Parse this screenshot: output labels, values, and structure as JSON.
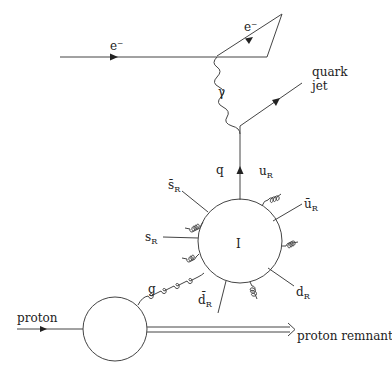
{
  "diagram": {
    "title": "",
    "labels": {
      "electron_in": "e⁻",
      "electron_out": "e⁻",
      "photon": "γ",
      "quark_jet_line1": "quark",
      "quark_jet_line2": "jet",
      "quark": "q",
      "instanton": "I",
      "gluon": "g",
      "proton": "proton",
      "proton_remnant": "proton remnant",
      "u_R": {
        "base": "u",
        "sub": "R"
      },
      "ubar_R": {
        "base": "ū",
        "sub": "R"
      },
      "d_R": {
        "base": "d",
        "sub": "R"
      },
      "dbar_R": {
        "base": "d̄",
        "sub": "R"
      },
      "s_R": {
        "base": "s",
        "sub": "R"
      },
      "sbar_R": {
        "base": "s̄",
        "sub": "R"
      }
    },
    "nodes": [
      {
        "id": "ee-gamma-vertex",
        "label": ""
      },
      {
        "id": "gamma-q-vertex",
        "label": ""
      },
      {
        "id": "instanton-blob",
        "label": "I"
      },
      {
        "id": "proton-blob",
        "label": ""
      }
    ],
    "edges": [
      {
        "from": "left",
        "to": "ee-gamma-vertex",
        "type": "fermion",
        "label": "e⁻"
      },
      {
        "from": "ee-gamma-vertex",
        "to": "upper-right",
        "type": "fermion",
        "label": "e⁻"
      },
      {
        "from": "ee-gamma-vertex",
        "to": "gamma-q-vertex",
        "type": "photon",
        "label": "γ"
      },
      {
        "from": "gamma-q-vertex",
        "to": "right",
        "type": "fermion",
        "label": "quark jet"
      },
      {
        "from": "instanton-blob",
        "to": "gamma-q-vertex",
        "type": "fermion",
        "label": "q"
      },
      {
        "from": "proton-blob",
        "to": "instanton-blob",
        "type": "gluon",
        "label": "g"
      },
      {
        "from": "left",
        "to": "proton-blob",
        "type": "fermion",
        "label": "proton"
      },
      {
        "from": "proton-blob",
        "to": "right",
        "type": "double-arrow",
        "label": "proton remnant"
      }
    ]
  }
}
